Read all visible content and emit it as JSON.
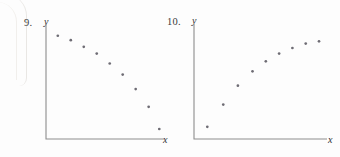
{
  "page": {
    "background_color": "#fdfdfd",
    "ink_color": "#3a3a3a",
    "point_color": "#6e6c74",
    "axis_color": "#8d8d8d"
  },
  "figures": [
    {
      "number_label": "9.",
      "y_axis_label": "y",
      "x_axis_label": "x"
    },
    {
      "number_label": "10.",
      "y_axis_label": "y",
      "x_axis_label": "x"
    }
  ],
  "chart_data": [
    {
      "type": "scatter",
      "title": "9.",
      "xlabel": "x",
      "ylabel": "y",
      "grid": false,
      "legend": false,
      "axis_ticks": false,
      "xlim": [
        0,
        10
      ],
      "ylim": [
        0,
        10
      ],
      "trend": "decreasing",
      "x": [
        1.0,
        2.1,
        3.2,
        4.3,
        5.4,
        6.5,
        7.6,
        8.7,
        9.6
      ],
      "y": [
        9.3,
        8.9,
        8.3,
        7.7,
        6.8,
        5.8,
        4.5,
        2.9,
        0.9
      ]
    },
    {
      "type": "scatter",
      "title": "10.",
      "xlabel": "x",
      "ylabel": "y",
      "grid": false,
      "legend": false,
      "axis_ticks": false,
      "xlim": [
        0,
        10
      ],
      "ylim": [
        0,
        10
      ],
      "trend": "increasing",
      "x": [
        1.0,
        2.2,
        3.3,
        4.4,
        5.4,
        6.4,
        7.4,
        8.4,
        9.4
      ],
      "y": [
        1.1,
        3.1,
        4.8,
        6.1,
        7.0,
        7.7,
        8.2,
        8.6,
        8.8
      ]
    }
  ]
}
